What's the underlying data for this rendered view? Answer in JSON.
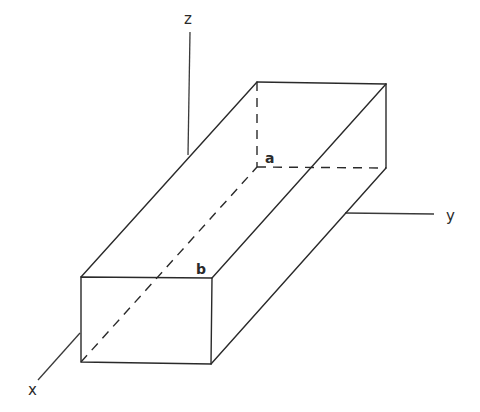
{
  "diagram": {
    "type": "3d-rectangular-prism-with-axes",
    "colors": {
      "line": "#2a2a2a",
      "background": "#ffffff"
    },
    "axes": {
      "x": {
        "label": "x",
        "from": [
          80,
          333
        ],
        "to": [
          38,
          380
        ],
        "label_pos": [
          32,
          392
        ]
      },
      "y": {
        "label": "y",
        "from": [
          345,
          213
        ],
        "to": [
          434,
          214
        ],
        "label_pos": [
          447,
          220
        ]
      },
      "z": {
        "label": "z",
        "from": [
          188,
          155
        ],
        "to": [
          190,
          32
        ],
        "label_pos": [
          185,
          24
        ]
      }
    },
    "points": {
      "a": {
        "label": "a",
        "vertex": [
          257,
          167
        ],
        "label_pos": [
          265,
          162
        ]
      },
      "b": {
        "label": "b",
        "vertex": [
          212,
          278
        ],
        "label_pos": [
          196,
          273
        ]
      }
    },
    "front_face": [
      [
        81,
        277
      ],
      [
        212,
        278
      ],
      [
        211,
        364
      ],
      [
        81,
        362
      ]
    ],
    "back_face": [
      [
        257,
        82
      ],
      [
        386,
        84
      ],
      [
        386,
        168
      ],
      [
        257,
        167
      ]
    ],
    "hidden_edges": [
      "back-left-vertical",
      "back-bottom",
      "bottom-left-depth"
    ]
  }
}
